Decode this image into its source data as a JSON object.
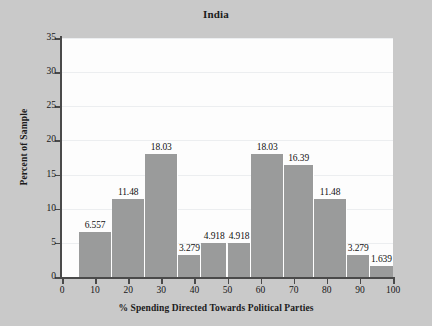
{
  "chart_data": {
    "type": "bar",
    "title": "India",
    "xlabel": "% Spending Directed Towards Political Parties",
    "ylabel": "Percent of Sample",
    "xlim": [
      0,
      100
    ],
    "ylim": [
      0,
      35
    ],
    "grid": true,
    "legend": null,
    "xticks": [
      "0",
      "10",
      "20",
      "30",
      "40",
      "50",
      "60",
      "70",
      "80",
      "90",
      "100"
    ],
    "xtick_values": [
      0,
      10,
      20,
      30,
      40,
      50,
      60,
      70,
      80,
      90,
      100
    ],
    "yticks": [
      "0",
      "5",
      "10",
      "15",
      "20",
      "25",
      "30",
      "35"
    ],
    "ytick_values": [
      0,
      5,
      10,
      15,
      20,
      25,
      30,
      35
    ],
    "bin_width": 10,
    "bin_starts": [
      5,
      15,
      25,
      35,
      45,
      55,
      65,
      75,
      85,
      95
    ],
    "categories": [
      "5-15",
      "15-25",
      "25-35",
      "35-45",
      "45-55",
      "55-65",
      "65-75",
      "75-85",
      "85-95",
      "95-105"
    ],
    "values": [
      6.557,
      11.48,
      18.03,
      3.279,
      4.918,
      4.918,
      18.03,
      16.39,
      11.48,
      3.279
    ],
    "bars": [
      {
        "bin_start": 5,
        "bin_end": 15,
        "value": 6.557,
        "label": "6.557"
      },
      {
        "bin_start": 15,
        "bin_end": 25,
        "value": 11.48,
        "label": "11.48"
      },
      {
        "bin_start": 25,
        "bin_end": 35,
        "value": 18.03,
        "label": "18.03"
      },
      {
        "bin_start": 35,
        "bin_end": 42,
        "value": 3.279,
        "label": "3.279"
      },
      {
        "bin_start": 42,
        "bin_end": 50,
        "value": 4.918,
        "label": "4.918"
      },
      {
        "bin_start": 50,
        "bin_end": 57,
        "value": 4.918,
        "label": "4.918"
      },
      {
        "bin_start": 57,
        "bin_end": 67,
        "value": 18.03,
        "label": "18.03"
      },
      {
        "bin_start": 67,
        "bin_end": 76,
        "value": 16.39,
        "label": "16.39"
      },
      {
        "bin_start": 76,
        "bin_end": 86,
        "value": 11.48,
        "label": "11.48"
      },
      {
        "bin_start": 86,
        "bin_end": 93,
        "value": 3.279,
        "label": "3.279"
      },
      {
        "bin_start": 93,
        "bin_end": 100,
        "value": 1.639,
        "label": "1.639"
      }
    ],
    "colors": {
      "bar_fill": "#9a9b9b",
      "plot_background": "#fdfdfd",
      "figure_background": "#c9c9c9",
      "axis_line": "#4a4a4a",
      "gridline": "#eceef0",
      "text": "#171717"
    }
  }
}
